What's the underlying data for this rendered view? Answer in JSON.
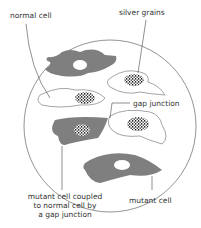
{
  "diagram": {
    "type": "cell culture dish illustration",
    "colors": {
      "mutant_cell": "#7f7f7f",
      "normal_cell_fill": "#ffffff",
      "outline": "#555555",
      "grains": "#222222"
    },
    "labels": {
      "normal_cell": "normal cell",
      "silver_grains": "silver grains",
      "gap_junction": "gap junction",
      "mutant_coupled_line1": "mutant cell coupled",
      "mutant_coupled_line2": "to normal cell by",
      "mutant_coupled_line3": "a gap junction",
      "mutant_cell": "mutant cell"
    }
  }
}
